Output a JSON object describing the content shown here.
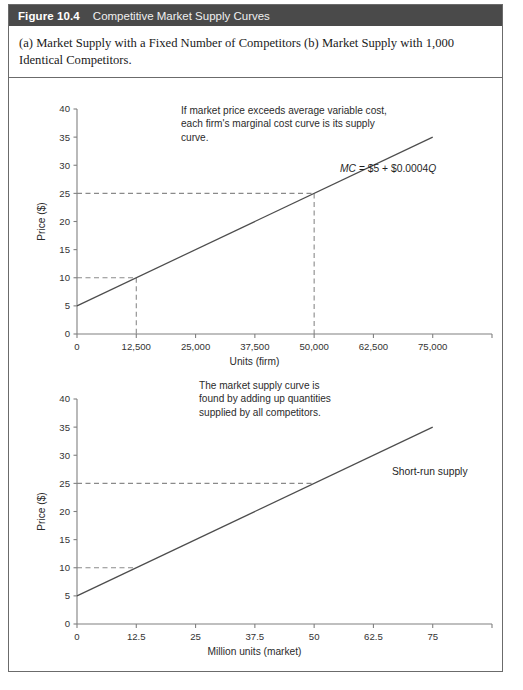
{
  "header": {
    "figure_number": "Figure 10.4",
    "title": "Competitive Market Supply Curves"
  },
  "caption": {
    "text": "(a) Market Supply with a Fixed Number of Competitors (b) Market Supply with 1,000 Identical Competitors."
  },
  "chart_a": {
    "annotation": "If market price exceeds average variable cost,\neach firm's marginal cost curve is its supply\ncurve.",
    "curve_label_parts": {
      "mc": "MC",
      "equals_intercept": " = $5 + $0.0004",
      "q": "Q"
    },
    "curve_label_full": "MC = $5 + $0.0004Q"
  },
  "chart_b": {
    "annotation": "The market supply curve is\nfound by adding up quantities\nsupplied by all competitors.",
    "curve_label": "Short-run supply"
  },
  "chart_data": [
    {
      "type": "line",
      "panel": "a",
      "title": "(a) Market Supply with a Fixed Number of Competitors",
      "xlabel": "Units (firm)",
      "ylabel": "Price ($)",
      "xlim": [
        0,
        87500
      ],
      "ylim": [
        0,
        40
      ],
      "grid": false,
      "legend_position": "inline-annotation",
      "x_ticks": [
        0,
        12500,
        25000,
        37500,
        50000,
        62500,
        75000,
        87500
      ],
      "x_tick_labels": [
        "0",
        "12,500",
        "25,000",
        "37,500",
        "50,000",
        "62,500",
        "75,000",
        ""
      ],
      "y_ticks": [
        0,
        5,
        10,
        15,
        20,
        25,
        30,
        35,
        40
      ],
      "y_tick_labels": [
        "0",
        "5",
        "10",
        "15",
        "20",
        "25",
        "30",
        "35",
        "40"
      ],
      "series": [
        {
          "name": "MC = $5 + $0.0004Q",
          "x": [
            0,
            75000
          ],
          "values": [
            5,
            35
          ]
        }
      ],
      "guides": [
        {
          "price": 10,
          "quantity": 12500,
          "horizontal": true,
          "vertical": true
        },
        {
          "price": 25,
          "quantity": 50000,
          "horizontal": true,
          "vertical": true
        }
      ],
      "annotations": [
        "If market price exceeds average variable cost, each firm's marginal cost curve is its supply curve.",
        "MC = $5 + $0.0004Q"
      ]
    },
    {
      "type": "line",
      "panel": "b",
      "title": "(b) Market Supply with 1,000 Identical Competitors",
      "xlabel": "Million units (market)",
      "ylabel": "Price ($)",
      "xlim": [
        0,
        87.5
      ],
      "ylim": [
        0,
        40
      ],
      "grid": false,
      "legend_position": "inline-annotation",
      "x_ticks": [
        0,
        12.5,
        25,
        37.5,
        50,
        62.5,
        75,
        87.5
      ],
      "x_tick_labels": [
        "0",
        "12.5",
        "25",
        "37.5",
        "50",
        "62.5",
        "75",
        ""
      ],
      "y_ticks": [
        0,
        5,
        10,
        15,
        20,
        25,
        30,
        35,
        40
      ],
      "y_tick_labels": [
        "0",
        "5",
        "10",
        "15",
        "20",
        "25",
        "30",
        "35",
        "40"
      ],
      "series": [
        {
          "name": "Short-run supply",
          "x": [
            0,
            75
          ],
          "values": [
            5,
            35
          ]
        }
      ],
      "guides": [
        {
          "price": 10,
          "quantity": 12.5,
          "horizontal": true,
          "vertical": false
        },
        {
          "price": 25,
          "quantity": 50,
          "horizontal": true,
          "vertical": false
        }
      ],
      "annotations": [
        "The market supply curve is found by adding up quantities supplied by all competitors.",
        "Short-run supply"
      ]
    }
  ]
}
